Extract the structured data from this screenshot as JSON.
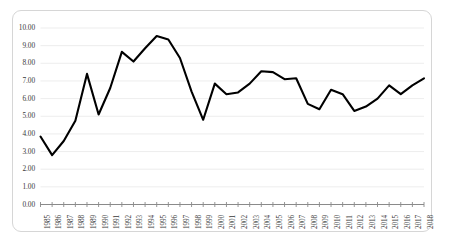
{
  "chart_data": {
    "type": "line",
    "title": "",
    "subtitle": "",
    "xlabel": "",
    "ylabel": "",
    "ylim": [
      0.0,
      10.0
    ],
    "ytick_step": 1.0,
    "ytick_labels": [
      "10.00",
      "9.00",
      "8.00",
      "7.00",
      "6.00",
      "5.00",
      "4.00",
      "3.00",
      "2.00",
      "1.00",
      "0.00"
    ],
    "ytick_values": [
      10.0,
      9.0,
      8.0,
      7.0,
      6.0,
      5.0,
      4.0,
      3.0,
      2.0,
      1.0,
      0.0
    ],
    "grid": true,
    "grid_axis": "y",
    "legend": false,
    "legend_position": "none",
    "line_color": "#000000",
    "line_width": 2.0,
    "markers": false,
    "categories": [
      "1985",
      "1986",
      "1987",
      "1988",
      "1989",
      "1990",
      "1991",
      "1992",
      "1993",
      "1994",
      "1995",
      "1996",
      "1997",
      "1998",
      "1999",
      "2000",
      "2001",
      "2002",
      "2003",
      "2004",
      "2005",
      "2006",
      "2007",
      "2008",
      "2009",
      "2010",
      "2011",
      "2012",
      "2013",
      "2014",
      "2015",
      "2016",
      "2017",
      "2018"
    ],
    "x": [
      1985,
      1986,
      1987,
      1988,
      1989,
      1990,
      1991,
      1992,
      1993,
      1994,
      1995,
      1996,
      1997,
      1998,
      1999,
      2000,
      2001,
      2002,
      2003,
      2004,
      2005,
      2006,
      2007,
      2008,
      2009,
      2010,
      2011,
      2012,
      2013,
      2014,
      2015,
      2016,
      2017,
      2018
    ],
    "values": [
      3.85,
      2.8,
      3.6,
      4.75,
      7.4,
      5.1,
      6.6,
      8.65,
      8.1,
      8.85,
      9.55,
      9.35,
      8.3,
      6.4,
      4.8,
      6.85,
      6.25,
      6.35,
      6.85,
      7.55,
      7.5,
      7.1,
      7.15,
      5.7,
      5.4,
      6.5,
      6.25,
      5.3,
      5.55,
      6.0,
      6.75,
      6.25,
      6.75,
      7.15
    ],
    "series": [
      {
        "name": "series-1",
        "color": "#000000",
        "values": [
          3.85,
          2.8,
          3.6,
          4.75,
          7.4,
          5.1,
          6.6,
          8.65,
          8.1,
          8.85,
          9.55,
          9.35,
          8.3,
          6.4,
          4.8,
          6.85,
          6.25,
          6.35,
          6.85,
          7.55,
          7.5,
          7.1,
          7.15,
          5.7,
          5.4,
          6.5,
          6.25,
          5.3,
          5.55,
          6.0,
          6.75,
          6.25,
          6.75,
          7.15
        ]
      }
    ],
    "axis_color": "#808080",
    "grid_color": "#e9e9e9",
    "frame_color": "#d6d6d6",
    "background": "#ffffff"
  }
}
